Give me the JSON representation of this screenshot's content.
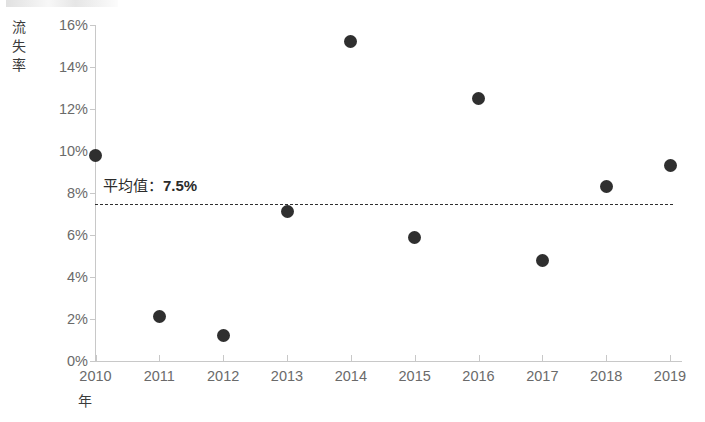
{
  "chart_data": {
    "type": "scatter",
    "title": "",
    "xlabel": "年",
    "ylabel": "流失率",
    "categories": [
      "2010",
      "2011",
      "2012",
      "2013",
      "2014",
      "2015",
      "2016",
      "2017",
      "2018",
      "2019"
    ],
    "x": [
      2010,
      2011,
      2012,
      2013,
      2014,
      2015,
      2016,
      2017,
      2018,
      2019
    ],
    "values": [
      9.8,
      2.1,
      1.2,
      7.1,
      15.2,
      5.9,
      12.5,
      4.8,
      8.3,
      9.3
    ],
    "value_unit": "%",
    "ylim": [
      0,
      16
    ],
    "xlim": [
      2010,
      2019
    ],
    "y_ticks": [
      "0%",
      "2%",
      "4%",
      "6%",
      "8%",
      "10%",
      "12%",
      "14%",
      "16%"
    ],
    "y_tick_values": [
      0,
      2,
      4,
      6,
      8,
      10,
      12,
      14,
      16
    ],
    "x_ticks": [
      "2010",
      "2011",
      "2012",
      "2013",
      "2014",
      "2015",
      "2016",
      "2017",
      "2018",
      "2019"
    ],
    "grid": false,
    "legend": false,
    "marker_color": "#2f2f2f",
    "axis_color": "#c8c8c8",
    "tick_label_color": "#6a6a6a",
    "background_color": "#ffffff",
    "annotations": [
      {
        "name": "average-line",
        "label_prefix": "平均值：",
        "label_value": "7.5%",
        "value": 7.5,
        "style": "dashed",
        "color": "#2f2f2f"
      }
    ]
  },
  "axes": {
    "y_title": "流失率",
    "x_title": "年"
  },
  "annotation": {
    "avg_prefix": "平均值：",
    "avg_value": "7.5%"
  }
}
